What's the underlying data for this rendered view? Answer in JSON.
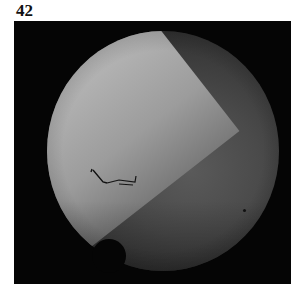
{
  "figure": {
    "label": "42",
    "annotations": [
      {
        "type": "arrow",
        "semantic": "arrow-icon",
        "position": "left-center, pointing to boundary"
      },
      {
        "type": "marker",
        "semantic": "star-marker",
        "position": "lower-right"
      }
    ]
  }
}
